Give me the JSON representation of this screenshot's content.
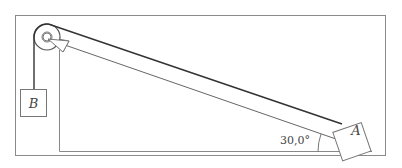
{
  "diagram": {
    "type": "physics-pulley-incline",
    "blocks": [
      {
        "id": "A",
        "label": "A",
        "position": "on incline"
      },
      {
        "id": "B",
        "label": "B",
        "position": "hanging"
      }
    ],
    "angle_label": "30,0°",
    "colors": {
      "frame": "#8a8a8a",
      "line": "#777777",
      "rope": "#333333",
      "text": "#444444"
    }
  }
}
